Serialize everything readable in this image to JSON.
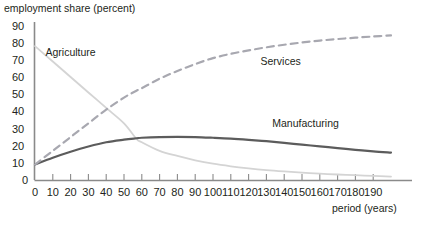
{
  "chart_data": {
    "type": "line",
    "title": "",
    "ylabel": "employment share (percent)",
    "xlabel": "period (years)",
    "xlim": [
      0,
      200
    ],
    "ylim": [
      0,
      90
    ],
    "grid": false,
    "legend_position": "inline-annotations",
    "y_ticks": [
      0,
      10,
      20,
      30,
      40,
      50,
      60,
      70,
      80,
      90
    ],
    "x_ticks": [
      0,
      10,
      20,
      30,
      40,
      50,
      60,
      70,
      80,
      90,
      100,
      110,
      120,
      130,
      140,
      150,
      160,
      170,
      180,
      190
    ],
    "x": [
      0,
      10,
      20,
      30,
      40,
      50,
      57,
      60,
      70,
      80,
      90,
      100,
      110,
      120,
      130,
      140,
      150,
      160,
      170,
      180,
      190,
      200
    ],
    "series": [
      {
        "name": "Agriculture",
        "label": "Agriculture",
        "color": "#d4d4d4",
        "style": "solid",
        "width": 1.8,
        "annotation": {
          "text": "Agriculture",
          "x": 20,
          "y": 72
        },
        "values": [
          78,
          69,
          60,
          51,
          42,
          33,
          24,
          22,
          17,
          14,
          11.5,
          9.5,
          8,
          6.8,
          5.8,
          5,
          4.3,
          3.7,
          3.2,
          2.8,
          2.4,
          2.0
        ]
      },
      {
        "name": "Manufacturing",
        "label": "Manufacturing",
        "color": "#5c5c5c",
        "style": "solid",
        "width": 2.2,
        "annotation": {
          "text": "Manufacturing",
          "x": 152,
          "y": 31
        },
        "values": [
          9,
          13,
          16.5,
          19.5,
          22,
          23.5,
          24.3,
          24.6,
          25,
          25.1,
          25,
          24.6,
          24.1,
          23.4,
          22.6,
          21.6,
          20.6,
          19.6,
          18.6,
          17.6,
          16.7,
          16.0
        ]
      },
      {
        "name": "Services",
        "label": "Services",
        "color": "#a8a8b0",
        "style": "dashed",
        "width": 2.2,
        "annotation": {
          "text": "Services",
          "x": 138,
          "y": 67
        },
        "values": [
          9,
          17,
          25,
          33,
          41,
          48,
          52,
          53.5,
          59,
          63.5,
          67.5,
          71,
          73.5,
          75.5,
          77.3,
          78.8,
          80.1,
          81.2,
          82.1,
          82.9,
          83.6,
          84.2
        ]
      }
    ]
  }
}
